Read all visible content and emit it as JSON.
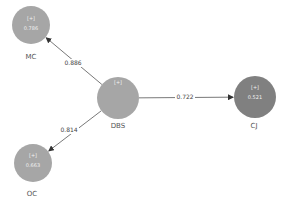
{
  "diagram": {
    "type": "path-model",
    "colors": {
      "node_default": "#a6a6a6",
      "node_endogenous_dark": "#7f7f7f",
      "edge": "#555555",
      "text": "#555555"
    },
    "nodes": [
      {
        "id": "MC",
        "label": "MC",
        "indicator": "[+]",
        "value": "0.786",
        "color": "#a6a6a6"
      },
      {
        "id": "DBS",
        "label": "DBS",
        "indicator": "[+]",
        "value": "",
        "color": "#a6a6a6"
      },
      {
        "id": "CJ",
        "label": "CJ",
        "indicator": "[+]",
        "value": "0.521",
        "color": "#808080"
      },
      {
        "id": "OC",
        "label": "OC",
        "indicator": "[+]",
        "value": "0.663",
        "color": "#a6a6a6"
      }
    ],
    "edges": [
      {
        "from": "DBS",
        "to": "MC",
        "coefficient": "0.886"
      },
      {
        "from": "DBS",
        "to": "CJ",
        "coefficient": "0.722"
      },
      {
        "from": "DBS",
        "to": "OC",
        "coefficient": "0.814"
      }
    ]
  }
}
